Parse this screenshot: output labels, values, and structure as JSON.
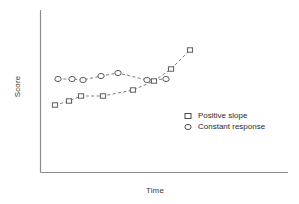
{
  "chart_data": {
    "type": "scatter",
    "title": "",
    "subtitle": "",
    "xlabel": "Time",
    "ylabel": "Score",
    "grid": false,
    "xlim": [
      0,
      10
    ],
    "ylim": [
      0,
      10
    ],
    "axis_ticks": false,
    "legend_position": "center-right",
    "marker_color": "#555555",
    "line_color": "#6b6b6b",
    "axis_color": "#8a8a8a",
    "line_style": "dashed",
    "series": [
      {
        "name": "Positive slope",
        "marker": "square",
        "x": [
          0.62,
          1.28,
          1.86,
          2.9,
          4.35,
          5.35,
          6.18,
          7.55
        ],
        "y": [
          3.78,
          4.1,
          4.55,
          4.55,
          5.1,
          5.85,
          6.85,
          7.95
        ],
        "points_px": [
          [
            55,
            105
          ],
          [
            69,
            101
          ],
          [
            81,
            96
          ],
          [
            103,
            96
          ],
          [
            133,
            90
          ],
          [
            154,
            81
          ],
          [
            171,
            69
          ],
          [
            190,
            50
          ]
        ]
      },
      {
        "name": "Constant response",
        "marker": "circle",
        "x": [
          0.75,
          1.42,
          1.95,
          2.8,
          3.62,
          5.02,
          5.95
        ],
        "y": [
          5.85,
          5.85,
          5.8,
          6.1,
          6.3,
          5.82,
          5.85
        ],
        "points_px": [
          [
            58,
            79
          ],
          [
            72,
            79
          ],
          [
            83,
            80
          ],
          [
            101,
            76
          ],
          [
            118,
            73
          ],
          [
            147,
            80
          ],
          [
            166,
            79
          ]
        ]
      }
    ]
  },
  "legend": {
    "items": [
      {
        "label": "Positive slope",
        "marker": "square"
      },
      {
        "label": "Constant response",
        "marker": "circle"
      }
    ]
  },
  "axes": {
    "x_label": "Time",
    "y_label": "Score"
  }
}
